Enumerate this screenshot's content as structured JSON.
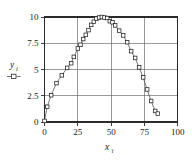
{
  "chart_data": {
    "type": "line",
    "title": "",
    "xlabel": "x i",
    "xlabel_base": "x",
    "xlabel_sub": "i",
    "ylabel": "y i",
    "ylabel_base": "y",
    "ylabel_sub": "i",
    "xlim": [
      0,
      100
    ],
    "ylim": [
      0,
      10
    ],
    "xticks": [
      0,
      25,
      50,
      75,
      100
    ],
    "xticklabels": [
      "0",
      "25",
      "50",
      "75",
      "100"
    ],
    "yticks": [
      0,
      2.5,
      5,
      7.5,
      10
    ],
    "yticklabels": [
      "0",
      "2.5",
      "5",
      "7.5",
      "10"
    ],
    "grid": true,
    "legend": "none",
    "marker": "open-square",
    "line_color": "#555555",
    "marker_edge_color": "#202020",
    "marker_face_color": "#ffffff",
    "grid_color": "#6e6e6e",
    "frame_color": "#2b2b2b",
    "series": [
      {
        "name": "y_i",
        "x": [
          0,
          2,
          5,
          9,
          13,
          17,
          20,
          22,
          25,
          27,
          29,
          31,
          33,
          35,
          37,
          39,
          41,
          43,
          45,
          47,
          49,
          51,
          53,
          56,
          59,
          62,
          65,
          68,
          71,
          74,
          77,
          80,
          83,
          85
        ],
        "y": [
          0.1,
          1.45,
          2.55,
          3.7,
          4.45,
          5.15,
          5.6,
          6.2,
          7.0,
          7.35,
          7.9,
          8.3,
          8.75,
          9.25,
          9.55,
          9.85,
          9.95,
          10.0,
          9.95,
          9.9,
          9.6,
          9.5,
          9.2,
          8.7,
          8.25,
          7.6,
          6.75,
          6.1,
          5.2,
          4.25,
          3.1,
          2.0,
          1.05,
          0.8
        ]
      }
    ]
  },
  "axis_marks": {
    "y_legend_label": "y",
    "y_legend_sub": "i"
  }
}
